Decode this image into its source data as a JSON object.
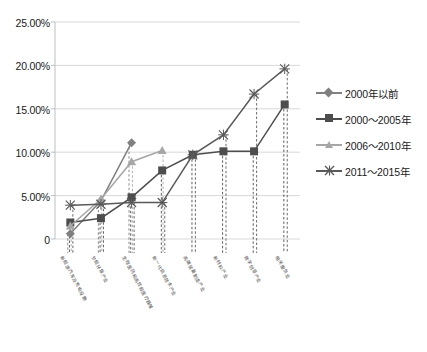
{
  "chart_data": {
    "type": "line",
    "title": "",
    "xlabel": "",
    "ylabel": "",
    "ylim": [
      0,
      25
    ],
    "yticks": [
      0,
      5,
      10,
      15,
      20,
      25
    ],
    "ytick_labels": [
      "0",
      "5.00%",
      "10.00%",
      "15.00%",
      "20.00%",
      "25.00%"
    ],
    "grid": true,
    "legend_position": "right",
    "categories": [
      "新能源汽车及充电设施",
      "节能环保产业",
      "生物医药和高性能医疗器械",
      "新一代信息技术产业",
      "高端装备制造产业",
      "新材料产业",
      "数字创意产业",
      "相关服务业"
    ],
    "series": [
      {
        "name": "2000年以前",
        "marker": "diamond",
        "color": "#808080",
        "values": [
          0.6,
          4.4,
          11.1,
          null,
          null,
          null,
          null,
          null
        ]
      },
      {
        "name": "2000~2005年",
        "marker": "square",
        "color": "#4d4d4d",
        "values": [
          1.9,
          2.4,
          4.8,
          7.9,
          9.7,
          10.1,
          10.1,
          15.5
        ]
      },
      {
        "name": "2006~2010年",
        "marker": "triangle",
        "color": "#a6a6a6",
        "values": [
          1.5,
          4.6,
          8.9,
          10.2,
          null,
          null,
          null,
          null
        ]
      },
      {
        "name": "2011~2015年",
        "marker": "x",
        "color": "#595959",
        "values": [
          3.9,
          4.0,
          4.2,
          4.2,
          9.7,
          12.0,
          16.7,
          19.6
        ]
      }
    ]
  },
  "legend": {
    "items": [
      {
        "label": "2000年以前"
      },
      {
        "label": "2000～2005年"
      },
      {
        "label": "2006～2010年"
      },
      {
        "label": "2011～2015年"
      }
    ]
  },
  "axes": {
    "y_tick_labels": [
      "25.00%",
      "20.00%",
      "15.00%",
      "10.00%",
      "5.00%",
      "0"
    ],
    "x_tick_labels": [
      "新能源汽车及充电设施",
      "节能环保产业",
      "生物医药和高性能医疗器械",
      "新一代信息技术产业",
      "高端装备制造产业",
      "新材料产业",
      "数字创意产业",
      "相关服务业"
    ]
  },
  "colors": {
    "series1": "#808080",
    "series2": "#4d4d4d",
    "series3": "#a6a6a6",
    "series4": "#595959",
    "grid": "#d9d9d9",
    "axis": "#bfbfbf",
    "text": "#1a1a1a"
  }
}
